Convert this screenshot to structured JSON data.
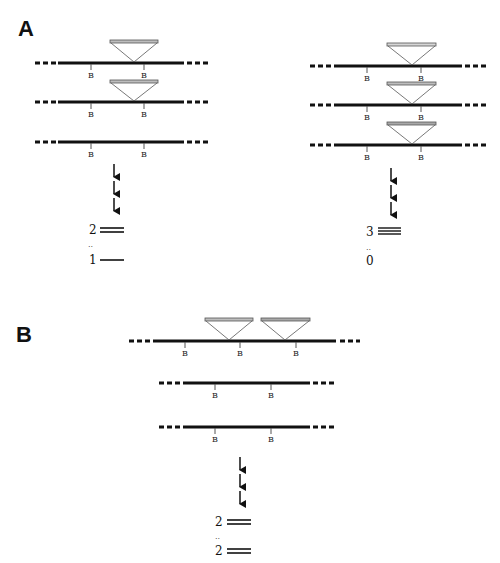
{
  "panels": [
    {
      "label": "A",
      "sub": [
        {
          "id": "A-left",
          "rows": [
            {
              "y": 63,
              "insertions": [
                {
                  "apex": 142
                }
              ]
            },
            {
              "y": 102,
              "insertions": [
                {
                  "apex": 142
                }
              ]
            },
            {
              "y": 142,
              "insertions": []
            }
          ],
          "site_label": "B",
          "result_counts": [
            {
              "count": "2",
              "bands": 2
            },
            {
              "count": "1",
              "bands": 1
            }
          ],
          "separator": ".."
        },
        {
          "id": "A-right",
          "rows": [
            {
              "y": 66,
              "insertions": [
                {
                  "apex": 412
                }
              ]
            },
            {
              "y": 105,
              "insertions": [
                {
                  "apex": 412
                }
              ]
            },
            {
              "y": 145,
              "insertions": [
                {
                  "apex": 412
                }
              ]
            }
          ],
          "site_label": "B",
          "result_counts": [
            {
              "count": "3",
              "bands": 3
            },
            {
              "count": "0",
              "bands": 0
            }
          ],
          "separator": ".."
        }
      ]
    },
    {
      "label": "B",
      "sub": [
        {
          "id": "B-center",
          "rows": [
            {
              "y": 341,
              "insertions": [
                {
                  "apex": 229
                },
                {
                  "apex": 285
                }
              ]
            },
            {
              "y": 383,
              "insertions": []
            },
            {
              "y": 427,
              "insertions": []
            }
          ],
          "site_label": "B",
          "result_counts": [
            {
              "count": "2",
              "bands": 2
            },
            {
              "count": "2",
              "bands": 2
            }
          ],
          "separator": ".."
        }
      ]
    }
  ],
  "labels": {
    "panel_a": "A",
    "panel_b": "B",
    "site": "B",
    "a_left_top_count": "2",
    "a_left_bottom_count": "1",
    "a_right_top_count": "3",
    "a_right_bottom_count": "0",
    "b_top_count": "2",
    "b_bottom_count": "2",
    "separator": ".."
  },
  "colors": {
    "line": "#111111",
    "insertion_bar": "#bdbdbd",
    "insertion_outline": "#555555"
  }
}
